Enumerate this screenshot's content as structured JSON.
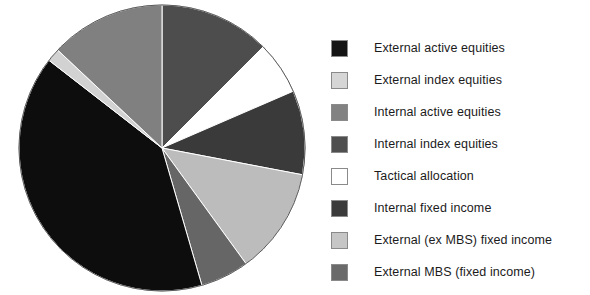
{
  "chart_data": {
    "type": "pie",
    "title": "",
    "subtitle": "",
    "xlabel": "",
    "ylabel": "",
    "legend_position": "right",
    "grid": false,
    "start_angle_deg": 0,
    "direction": "clockwise",
    "categories": [
      "External active equities",
      "External index equities",
      "Internal active equities",
      "Internal index equities",
      "Tactical allocation",
      "Internal fixed income",
      "External (ex MBS) fixed income",
      "External MBS (fixed income)"
    ],
    "values": [
      40.0,
      1.5,
      13.0,
      12.5,
      6.0,
      9.5,
      12.0,
      5.5
    ],
    "colors": [
      "#0d0d0d",
      "#d2d2d2",
      "#808080",
      "#4d4d4d",
      "#ffffff",
      "#3a3a3a",
      "#bcbcbc",
      "#666666"
    ],
    "slices": [
      {
        "label": "Internal index equities",
        "value": 12.5,
        "color": "#4d4d4d"
      },
      {
        "label": "Tactical allocation",
        "value": 6.0,
        "color": "#ffffff"
      },
      {
        "label": "Internal fixed income",
        "value": 9.5,
        "color": "#3a3a3a"
      },
      {
        "label": "External (ex MBS) fixed income",
        "value": 12.0,
        "color": "#bcbcbc"
      },
      {
        "label": "External MBS (fixed income)",
        "value": 5.5,
        "color": "#666666"
      },
      {
        "label": "External active equities",
        "value": 40.0,
        "color": "#0d0d0d"
      },
      {
        "label": "External index equities",
        "value": 1.5,
        "color": "#d2d2d2"
      },
      {
        "label": "Internal active equities",
        "value": 13.0,
        "color": "#808080"
      }
    ],
    "geometry": {
      "cx": 162,
      "cy": 148,
      "r": 143,
      "stroke": "#ffffff",
      "stroke_width": 1
    }
  },
  "legend": {
    "items": [
      {
        "label": "External active equities",
        "color": "#141414",
        "swatch": "legend-swatch-external-active-equities"
      },
      {
        "label": "External index equities",
        "color": "#d6d6d6",
        "swatch": "legend-swatch-external-index-equities"
      },
      {
        "label": "Internal active equities",
        "color": "#828282",
        "swatch": "legend-swatch-internal-active-equities"
      },
      {
        "label": "Internal index equities",
        "color": "#4f4f4f",
        "swatch": "legend-swatch-internal-index-equities"
      },
      {
        "label": "Tactical allocation",
        "color": "#ffffff",
        "swatch": "legend-swatch-tactical-allocation"
      },
      {
        "label": "Internal fixed income",
        "color": "#3b3b3b",
        "swatch": "legend-swatch-internal-fixed-income"
      },
      {
        "label": "External (ex MBS) fixed income",
        "color": "#c6c6c6",
        "swatch": "legend-swatch-external-ex-mbs-fixed-income"
      },
      {
        "label": "External MBS (fixed income)",
        "color": "#6a6a6a",
        "swatch": "legend-swatch-external-mbs-fixed-income"
      }
    ]
  }
}
